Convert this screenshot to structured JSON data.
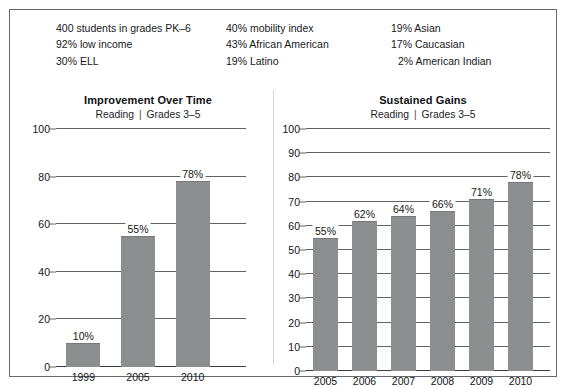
{
  "demographics": {
    "columns": [
      {
        "lines": [
          {
            "text": "400 students in grades PK–6",
            "indent": false
          },
          {
            "text": "92% low income",
            "indent": false
          },
          {
            "text": "30% ELL",
            "indent": false
          }
        ]
      },
      {
        "lines": [
          {
            "text": "40% mobility index",
            "indent": false
          },
          {
            "text": "43% African American",
            "indent": false
          },
          {
            "text": "19% Latino",
            "indent": false
          }
        ]
      },
      {
        "lines": [
          {
            "text": "19% Asian",
            "indent": false
          },
          {
            "text": "17% Caucasian",
            "indent": false
          },
          {
            "text": "2% American Indian",
            "indent": true
          }
        ]
      }
    ]
  },
  "charts": [
    {
      "title": "Improvement Over Time",
      "subtitle_left": "Reading",
      "subtitle_sep": "|",
      "subtitle_right": "Grades 3–5"
    },
    {
      "title": "Sustained Gains",
      "subtitle_left": "Reading",
      "subtitle_sep": "|",
      "subtitle_right": "Grades 3–5"
    }
  ],
  "chart_data": [
    {
      "type": "bar",
      "title": "Improvement Over Time",
      "subtitle": "Reading | Grades 3–5",
      "xlabel": "",
      "ylabel": "",
      "categories": [
        "1999",
        "2005",
        "2010"
      ],
      "values": [
        10,
        55,
        78
      ],
      "data_labels": [
        "10%",
        "55%",
        "78%"
      ],
      "ylim": [
        0,
        100
      ],
      "yticks": [
        0,
        20,
        40,
        60,
        80,
        100
      ],
      "ytick_labels": [
        "0",
        "20",
        "40",
        "60",
        "80",
        "100"
      ],
      "grid": true,
      "legend": "none",
      "bar_color": "#8d8e90"
    },
    {
      "type": "bar",
      "title": "Sustained Gains",
      "subtitle": "Reading | Grades 3–5",
      "xlabel": "",
      "ylabel": "",
      "categories": [
        "2005",
        "2006",
        "2007",
        "2008",
        "2009",
        "2010"
      ],
      "values": [
        55,
        62,
        64,
        66,
        71,
        78
      ],
      "data_labels": [
        "55%",
        "62%",
        "64%",
        "66%",
        "71%",
        "78%"
      ],
      "ylim": [
        0,
        100
      ],
      "yticks": [
        0,
        10,
        20,
        30,
        40,
        50,
        60,
        70,
        80,
        90,
        100
      ],
      "ytick_labels": [
        "0",
        "10",
        "20",
        "30",
        "40",
        "50",
        "60",
        "70",
        "80",
        "90",
        "100"
      ],
      "grid": true,
      "legend": "none",
      "bar_color": "#8d8e90"
    }
  ]
}
